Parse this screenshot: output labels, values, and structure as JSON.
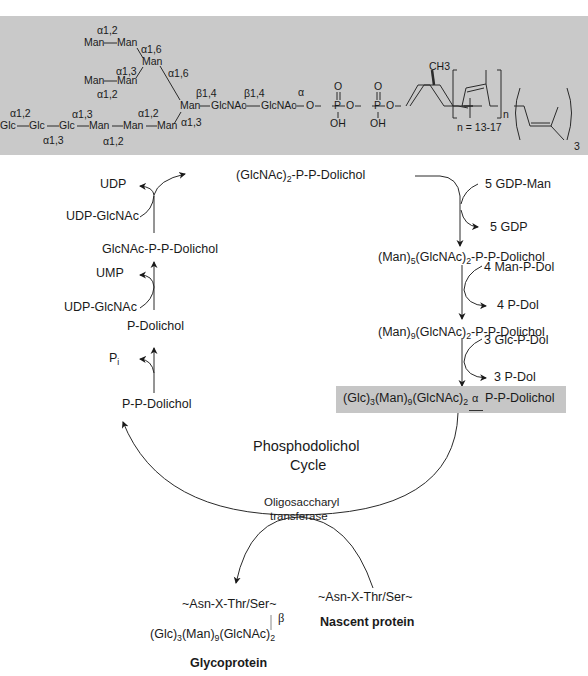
{
  "structure_panel": {
    "background": "#c9c9c9",
    "sugars": {
      "man_a": "Man",
      "man_b": "Man",
      "man_c": "Man",
      "man_d": "Man",
      "man_e": "Man",
      "man_core": "Man",
      "man_f": "Man",
      "man_g": "Man",
      "man_h": "Man",
      "glc_1": "Glc",
      "glc_2": "Glc",
      "glc_3": "Glc",
      "glcnac_1": "GlcNAc",
      "glcnac_2": "GlcNAc"
    },
    "linkages": {
      "a12_top": "α1,2",
      "a16_upper": "α1,6",
      "a13_mid": "α1,3",
      "a12_mid": "α1,2",
      "a16_right": "α1,6",
      "b14_1": "β1,4",
      "b14_2": "β1,4",
      "alpha": "α",
      "a12_glc": "α1,2",
      "a13_glc_top": "α1,3",
      "a13_glc_bot": "α1,3",
      "a12_man_top": "α1,2",
      "a12_man_bot": "α1,2",
      "a13_core": "α1,3"
    },
    "phosphate": {
      "o": "O",
      "p": "P",
      "oh": "OH"
    },
    "lipid": {
      "ch3": "CH3",
      "n_sub": "n",
      "n_range": "n = 13-17",
      "three": "3"
    }
  },
  "cycle": {
    "title_line1": "Phosphodolichol",
    "title_line2": "Cycle",
    "enzyme_line1": "Oligosaccharyl",
    "enzyme_line2": "transferase"
  },
  "left_branch": {
    "udp": "UDP",
    "udp_glcnac_1": "UDP-GlcNAc",
    "glcnac_ppdol": "GlcNAc-P-P-Dolichol",
    "ump": "UMP",
    "udp_glcnac_2": "UDP-GlcNAc",
    "p_dolichol": "P-Dolichol",
    "pi": "P",
    "pi_sub": "i",
    "pp_dolichol": "P-P-Dolichol"
  },
  "top": {
    "glcnac2_ppdol_pre": "(GlcNAc)",
    "glcnac2_ppdol_sub": "2",
    "glcnac2_ppdol_post": "-P-P-Dolichol"
  },
  "right_branch": {
    "gdp_man": "5 GDP-Man",
    "gdp": "5 GDP",
    "man5": {
      "a": "(Man)",
      "s1": "5",
      "b": "(GlcNAc)",
      "s2": "2",
      "c": "-P-P-Dolichol"
    },
    "man_p_dol": "4 Man-P-Dol",
    "p_dol_4": "4 P-Dol",
    "man9": {
      "a": "(Man)",
      "s1": "9",
      "b": "(GlcNAc)",
      "s2": "2",
      "c": "-P-P-Dolichol"
    },
    "glc_p_dol": "3 Glc-P-Dol",
    "p_dol_3": "3 P-Dol",
    "final": {
      "a": "(Glc)",
      "s1": "3",
      "b": "(Man)",
      "s2": "9",
      "c": "(GlcNAc)",
      "s3": "2",
      "alpha": "α",
      "d": "P-P-Dolichol"
    },
    "highlight_color": "#c6c6c6"
  },
  "bottom": {
    "glyco_seq": "~Asn-X-Thr/Ser~",
    "beta": "β",
    "glyco_chain": {
      "a": "(Glc)",
      "s1": "3",
      "b": "(Man)",
      "s2": "9",
      "c": "(GlcNAc)",
      "s3": "2"
    },
    "glycoprotein": "Glycoprotein",
    "nascent_seq": "~Asn-X-Thr/Ser~",
    "nascent_protein": "Nascent protein"
  }
}
